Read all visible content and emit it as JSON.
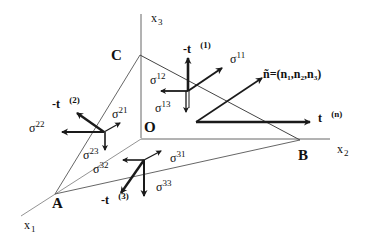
{
  "diagram": {
    "colors": {
      "line": "#555555",
      "arrow": "#1a1a1a",
      "text": "#111111",
      "background": "#ffffff"
    },
    "points": {
      "origin": "O",
      "a": "A",
      "b": "B",
      "c": "C"
    },
    "axes": {
      "x1": {
        "base": "x",
        "sub": "1"
      },
      "x2": {
        "base": "x",
        "sub": "2"
      },
      "x3": {
        "base": "x",
        "sub": "3"
      }
    },
    "normal_label": "ñ=(n₁,n₂,n₃)",
    "traction_labels": {
      "tn": {
        "base": "t⃗",
        "sup": "(n)"
      },
      "t1": {
        "base": "-t⃗",
        "sup": "(1)"
      },
      "t2": {
        "base": "-t⃗",
        "sup": "(2)"
      },
      "t3": {
        "base": "-t⃗",
        "sup": "(3)"
      }
    },
    "stress_labels": {
      "s11": {
        "base": "σ",
        "sup": "11"
      },
      "s12": {
        "base": "σ",
        "sup": "12"
      },
      "s13": {
        "base": "σ",
        "sup": "13"
      },
      "s21": {
        "base": "σ",
        "sup": "21"
      },
      "s22": {
        "base": "σ",
        "sup": "22"
      },
      "s23": {
        "base": "σ",
        "sup": "23"
      },
      "s31": {
        "base": "σ",
        "sup": "31"
      },
      "s32": {
        "base": "σ",
        "sup": "32"
      },
      "s33": {
        "base": "σ",
        "sup": "33"
      }
    }
  }
}
